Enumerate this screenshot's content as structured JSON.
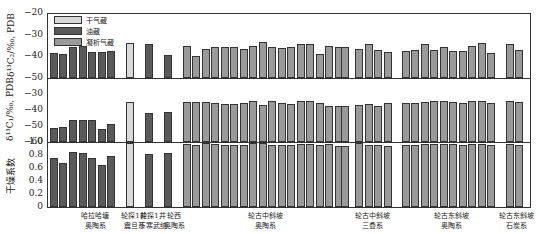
{
  "chart_data": {
    "type": "bar",
    "layout": "three stacked panels sharing x-axis",
    "colors": {
      "dry_gas": "#d9d9d9",
      "oil": "#5a5a5a",
      "condensate": "#9a9a9a"
    },
    "legend": [
      {
        "key": "dry_gas",
        "label": "干气藏"
      },
      {
        "key": "oil",
        "label": "油藏"
      },
      {
        "key": "condensate",
        "label": "凝析气藏"
      }
    ],
    "groups": [
      {
        "label": [
          "哈拉哈塘",
          "奥陶系"
        ],
        "center": 95
      },
      {
        "label": [
          "轮探1井",
          "震旦系"
        ],
        "center": 134
      },
      {
        "label": [
          "轮探1井",
          "下寒武统"
        ],
        "center": 153
      },
      {
        "label": [
          "轮西",
          "奥陶系"
        ],
        "center": 174
      },
      {
        "label": [
          "轮古中斜坡",
          "奥陶系"
        ],
        "center": 265
      },
      {
        "label": [
          "轮古中斜坡",
          "三叠系"
        ],
        "center": 372
      },
      {
        "label": [
          "轮古东斜坡",
          "奥陶系"
        ],
        "center": 451
      },
      {
        "label": [
          "轮古东斜坡",
          "石炭系"
        ],
        "center": 516
      }
    ],
    "bars": [
      {
        "x": 53,
        "type": "oil",
        "c2": -38.5,
        "c1": -51,
        "dry": 0.76
      },
      {
        "x": 62,
        "type": "oil",
        "c2": -39,
        "c1": -50.5,
        "dry": 0.67
      },
      {
        "x": 72,
        "type": "oil",
        "c2": -35.5,
        "c1": -46,
        "dry": 0.84
      },
      {
        "x": 82,
        "type": "oil",
        "c2": -35,
        "c1": -46,
        "dry": 0.83
      },
      {
        "x": 91,
        "type": "oil",
        "c2": -38,
        "c1": -46,
        "dry": 0.76
      },
      {
        "x": 101,
        "type": "oil",
        "c2": -38,
        "c1": -52,
        "dry": 0.65
      },
      {
        "x": 110,
        "type": "oil",
        "c2": -37.5,
        "c1": -48.5,
        "dry": 0.79
      },
      {
        "x": 129,
        "type": "dry_gas",
        "c2": -34,
        "c1": -35,
        "dry": 0.99
      },
      {
        "x": 148,
        "type": "oil",
        "c2": -34.5,
        "c1": -42,
        "dry": 0.81
      },
      {
        "x": 167,
        "type": "oil",
        "c2": -39.5,
        "c1": -41.5,
        "dry": 0.83
      },
      {
        "x": 186,
        "type": "condensate",
        "c2": -35,
        "c1": -35,
        "dry": 0.97
      },
      {
        "x": 195,
        "type": "condensate",
        "c2": -40,
        "c1": -35,
        "dry": 0.96
      },
      {
        "x": 205,
        "type": "condensate",
        "c2": -36.5,
        "c1": -35,
        "dry": 0.98
      },
      {
        "x": 214,
        "type": "condensate",
        "c2": -35.5,
        "c1": -35.5,
        "dry": 0.97
      },
      {
        "x": 224,
        "type": "condensate",
        "c2": -35.5,
        "c1": -36,
        "dry": 0.95
      },
      {
        "x": 233,
        "type": "condensate",
        "c2": -35.5,
        "c1": -36,
        "dry": 0.96
      },
      {
        "x": 243,
        "type": "condensate",
        "c2": -36.5,
        "c1": -35.5,
        "dry": 0.96
      },
      {
        "x": 252,
        "type": "condensate",
        "c2": -35,
        "c1": -34.5,
        "dry": 0.98
      },
      {
        "x": 262,
        "type": "condensate",
        "c2": -33.5,
        "c1": -37,
        "dry": 0.98
      },
      {
        "x": 271,
        "type": "condensate",
        "c2": -35.5,
        "c1": -34.5,
        "dry": 0.96
      },
      {
        "x": 281,
        "type": "condensate",
        "c2": -36,
        "c1": -35.5,
        "dry": 0.96
      },
      {
        "x": 290,
        "type": "condensate",
        "c2": -35.5,
        "c1": -36,
        "dry": 0.95
      },
      {
        "x": 300,
        "type": "condensate",
        "c2": -34.5,
        "c1": -34.5,
        "dry": 0.97
      },
      {
        "x": 309,
        "type": "condensate",
        "c2": -34.5,
        "c1": -34.5,
        "dry": 0.97
      },
      {
        "x": 319,
        "type": "condensate",
        "c2": -39,
        "c1": -35.5,
        "dry": 0.96
      },
      {
        "x": 328,
        "type": "condensate",
        "c2": -35,
        "c1": -37.5,
        "dry": 0.97
      },
      {
        "x": 338,
        "type": "condensate",
        "c2": -35.5,
        "c1": -37.5,
        "dry": 0.94
      },
      {
        "x": 344,
        "type": "condensate",
        "c2": -35.5,
        "c1": -37.5,
        "dry": 0.94
      },
      {
        "x": 358,
        "type": "condensate",
        "c2": -36.5,
        "c1": -37,
        "dry": 0.98
      },
      {
        "x": 368,
        "type": "condensate",
        "c2": -34.5,
        "c1": -36,
        "dry": 0.95
      },
      {
        "x": 377,
        "type": "condensate",
        "c2": -37,
        "c1": -37.5,
        "dry": 0.95
      },
      {
        "x": 387,
        "type": "condensate",
        "c2": -38,
        "c1": -35.5,
        "dry": 0.94
      },
      {
        "x": 405,
        "type": "condensate",
        "c2": -37.5,
        "c1": -35.5,
        "dry": 0.96
      },
      {
        "x": 414,
        "type": "condensate",
        "c2": -37,
        "c1": -35.5,
        "dry": 0.96
      },
      {
        "x": 424,
        "type": "condensate",
        "c2": -34.5,
        "c1": -35,
        "dry": 0.97
      },
      {
        "x": 433,
        "type": "condensate",
        "c2": -37,
        "c1": -34.5,
        "dry": 0.97
      },
      {
        "x": 443,
        "type": "condensate",
        "c2": -35.5,
        "c1": -34.5,
        "dry": 0.97
      },
      {
        "x": 452,
        "type": "condensate",
        "c2": -37.5,
        "c1": -35,
        "dry": 0.97
      },
      {
        "x": 462,
        "type": "condensate",
        "c2": -37.5,
        "c1": -35.5,
        "dry": 0.96
      },
      {
        "x": 471,
        "type": "condensate",
        "c2": -35,
        "c1": -34.5,
        "dry": 0.97
      },
      {
        "x": 481,
        "type": "condensate",
        "c2": -34,
        "c1": -34.5,
        "dry": 0.97
      },
      {
        "x": 490,
        "type": "condensate",
        "c2": -38.5,
        "c1": -35.5,
        "dry": 0.96
      },
      {
        "x": 509,
        "type": "condensate",
        "c2": -34.5,
        "c1": -34.5,
        "dry": 0.97
      },
      {
        "x": 518,
        "type": "condensate",
        "c2": -37,
        "c1": -35,
        "dry": 0.95
      }
    ],
    "panels": [
      {
        "key": "c2",
        "ylabel": "δ¹³C₂/‰, PDB",
        "ylim": [
          -50,
          -20
        ],
        "ticks": [
          "-20",
          "-30",
          "-40",
          "-50"
        ],
        "top": 13,
        "bottom": 78
      },
      {
        "key": "c1",
        "ylabel": "δ¹³C₁/‰, PDB",
        "ylim": [
          -60,
          -20
        ],
        "ticks": [
          "-30",
          "-40",
          "-50",
          "-60"
        ],
        "top": 78,
        "bottom": 142
      },
      {
        "key": "dry",
        "ylabel": "干燥系数",
        "ylim": [
          0,
          1.0
        ],
        "ticks": [
          "1.0",
          "0.8",
          "0.6",
          "0.4",
          "0.2",
          "0"
        ],
        "top": 142,
        "bottom": 207
      }
    ]
  }
}
